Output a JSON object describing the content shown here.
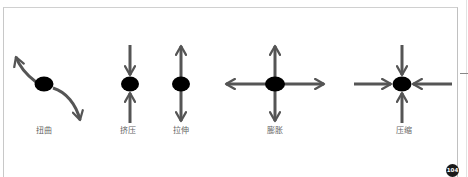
{
  "page": {
    "page_number": "104"
  },
  "colors": {
    "arrow": "#555555",
    "node": "#000000",
    "label": "#666666",
    "frame": "#c8c8c8"
  },
  "diagram": {
    "items": [
      {
        "id": "twist",
        "label": "扭曲",
        "label_x": 44
      },
      {
        "id": "squeeze",
        "label": "挤压",
        "label_x": 128
      },
      {
        "id": "stretch",
        "label": "拉伸",
        "label_x": 181
      },
      {
        "id": "expand",
        "label": "膨胀",
        "label_x": 275
      },
      {
        "id": "compress",
        "label": "压缩",
        "label_x": 404
      }
    ]
  }
}
